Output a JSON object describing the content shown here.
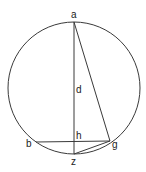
{
  "diagram": {
    "type": "geometry",
    "circle": {
      "cx": 74,
      "cy": 88,
      "r": 66
    },
    "points": {
      "a": {
        "label": "a",
        "x": 74,
        "y": 22
      },
      "b": {
        "label": "b",
        "x": 36,
        "y": 142
      },
      "g": {
        "label": "g",
        "x": 110,
        "y": 141
      },
      "h": {
        "label": "h",
        "x": 74,
        "y": 142
      },
      "z": {
        "label": "z",
        "x": 74,
        "y": 154
      },
      "d": {
        "label": "d",
        "x": 74,
        "y": 88
      }
    },
    "segments": [
      [
        "a",
        "z"
      ],
      [
        "a",
        "g"
      ],
      [
        "b",
        "g"
      ],
      [
        "z",
        "g"
      ]
    ],
    "arcs": [
      "z-g arc"
    ],
    "colors": {
      "stroke": "#3a3a3a",
      "text": "#222222"
    }
  }
}
